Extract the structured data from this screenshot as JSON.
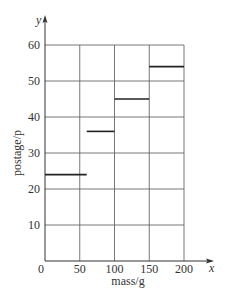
{
  "chart_data": {
    "type": "line",
    "subtype": "step",
    "title": "",
    "xlabel": "mass/g",
    "ylabel": "postage/p",
    "x_axis_symbol": "x",
    "y_axis_symbol": "y",
    "xlim": [
      0,
      200
    ],
    "ylim": [
      0,
      60
    ],
    "x_ticks": [
      0,
      50,
      100,
      150,
      200
    ],
    "y_ticks": [
      10,
      20,
      30,
      40,
      50,
      60
    ],
    "x_tick_labels": [
      "0",
      "50",
      "100",
      "150",
      "200"
    ],
    "y_tick_labels": [
      "10",
      "20",
      "30",
      "40",
      "50",
      "60"
    ],
    "grid": true,
    "legend": null,
    "series": [
      {
        "name": "postage",
        "segments": [
          {
            "x_start": 0,
            "x_end": 60,
            "y": 24
          },
          {
            "x_start": 60,
            "x_end": 100,
            "y": 36
          },
          {
            "x_start": 100,
            "x_end": 150,
            "y": 45
          },
          {
            "x_start": 150,
            "x_end": 200,
            "y": 54
          }
        ]
      }
    ]
  },
  "colors": {
    "axis": "#333333",
    "grid": "#555555",
    "step": "#222222"
  }
}
